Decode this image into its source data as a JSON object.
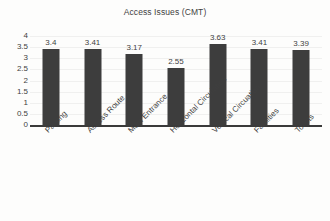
{
  "chart_data": {
    "type": "bar",
    "title": "Access Issues (CMT)",
    "xlabel": "",
    "ylabel": "",
    "categories": [
      "Parking",
      "Access Route",
      "Main Entrance",
      "Horizontal Circulation",
      "Vertical Circuation",
      "Facilities",
      "Toilets"
    ],
    "values": [
      3.4,
      3.41,
      3.17,
      2.55,
      3.63,
      3.41,
      3.39
    ],
    "value_labels": [
      "3.4",
      "3.41",
      "3.17",
      "2.55",
      "3.63",
      "3.41",
      "3.39"
    ],
    "ylim": [
      0,
      4
    ],
    "ytick_labels": [
      "4",
      "3.5",
      "3",
      "2.5",
      "2",
      "1.5",
      "1",
      "0.5",
      "0"
    ],
    "ytick_values": [
      4,
      3.5,
      3,
      2.5,
      2,
      1.5,
      1,
      0.5,
      0
    ],
    "grid": true,
    "legend": "none",
    "bar_color": "#3d3d3d",
    "axis_color": "#3a3a3a",
    "text_color": "#3f3f3f",
    "background_color": "#fdfdfc"
  }
}
